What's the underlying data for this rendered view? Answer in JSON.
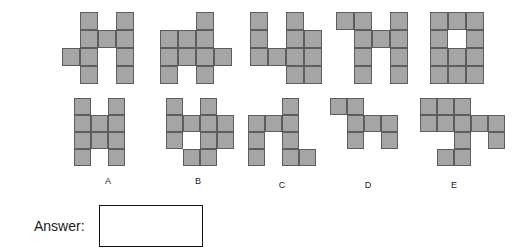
{
  "question_shapes": [
    {
      "id": "question-shape-1",
      "x": 62,
      "y": 12,
      "cell": 18,
      "cols": 4,
      "rows": 4,
      "grid": [
        [
          0,
          1,
          0,
          1
        ],
        [
          0,
          1,
          1,
          1
        ],
        [
          1,
          1,
          0,
          1
        ],
        [
          0,
          1,
          0,
          1
        ]
      ]
    },
    {
      "id": "question-shape-2",
      "x": 160,
      "y": 12,
      "cell": 18,
      "cols": 4,
      "rows": 4,
      "grid": [
        [
          0,
          0,
          1,
          0
        ],
        [
          1,
          1,
          1,
          0
        ],
        [
          1,
          1,
          1,
          1
        ],
        [
          1,
          0,
          1,
          0
        ]
      ]
    },
    {
      "id": "question-shape-3",
      "x": 250,
      "y": 12,
      "cell": 18,
      "cols": 4,
      "rows": 4,
      "grid": [
        [
          1,
          0,
          1,
          0
        ],
        [
          1,
          0,
          1,
          1
        ],
        [
          1,
          1,
          1,
          1
        ],
        [
          0,
          0,
          1,
          1
        ]
      ]
    },
    {
      "id": "question-shape-4",
      "x": 336,
      "y": 12,
      "cell": 18,
      "cols": 4,
      "rows": 4,
      "grid": [
        [
          1,
          1,
          0,
          1
        ],
        [
          0,
          1,
          1,
          1
        ],
        [
          0,
          1,
          0,
          1
        ],
        [
          0,
          1,
          0,
          1
        ]
      ]
    },
    {
      "id": "question-shape-5",
      "x": 430,
      "y": 12,
      "cell": 18,
      "cols": 3,
      "rows": 4,
      "grid": [
        [
          1,
          1,
          1
        ],
        [
          1,
          0,
          1
        ],
        [
          1,
          1,
          1
        ],
        [
          1,
          1,
          1
        ]
      ]
    }
  ],
  "option_shapes": [
    {
      "id": "option-shape-a",
      "label": "A",
      "x": 74,
      "y": 98,
      "cell": 17,
      "cols": 3,
      "rows": 4,
      "label_x": 98,
      "label_y": 176,
      "grid": [
        [
          1,
          0,
          1
        ],
        [
          1,
          1,
          1
        ],
        [
          1,
          1,
          1
        ],
        [
          1,
          0,
          1
        ]
      ]
    },
    {
      "id": "option-shape-b",
      "label": "B",
      "x": 166,
      "y": 98,
      "cell": 17,
      "cols": 4,
      "rows": 4,
      "label_x": 188,
      "label_y": 176,
      "grid": [
        [
          1,
          0,
          1,
          0
        ],
        [
          1,
          1,
          1,
          1
        ],
        [
          1,
          0,
          1,
          1
        ],
        [
          0,
          1,
          1,
          0
        ]
      ]
    },
    {
      "id": "option-shape-c",
      "label": "C",
      "x": 248,
      "y": 98,
      "cell": 17,
      "cols": 4,
      "rows": 4,
      "label_x": 272,
      "label_y": 180,
      "grid": [
        [
          0,
          0,
          1,
          0
        ],
        [
          1,
          1,
          1,
          0
        ],
        [
          1,
          0,
          1,
          0
        ],
        [
          1,
          0,
          1,
          1
        ]
      ]
    },
    {
      "id": "option-shape-d",
      "label": "D",
      "x": 330,
      "y": 98,
      "cell": 17,
      "cols": 4,
      "rows": 3,
      "label_x": 358,
      "label_y": 180,
      "grid": [
        [
          1,
          1,
          0,
          0
        ],
        [
          0,
          1,
          1,
          1
        ],
        [
          0,
          1,
          0,
          1
        ]
      ]
    },
    {
      "id": "option-shape-e",
      "label": "E",
      "x": 420,
      "y": 98,
      "cell": 17,
      "cols": 5,
      "rows": 4,
      "label_x": 444,
      "label_y": 180,
      "grid": [
        [
          1,
          1,
          1,
          0,
          0
        ],
        [
          1,
          1,
          1,
          1,
          1
        ],
        [
          0,
          0,
          1,
          0,
          1
        ],
        [
          0,
          1,
          1,
          0,
          0
        ]
      ]
    }
  ],
  "answer": {
    "label": "Answer:",
    "value": ""
  },
  "colors": {
    "cell_fill": "#a5a5a5",
    "cell_stroke": "#5d5d5d",
    "box_stroke": "#111111",
    "background": "#ffffff"
  }
}
